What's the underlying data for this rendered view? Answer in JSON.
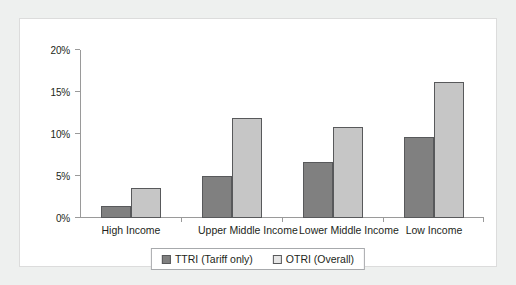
{
  "chart_data": {
    "type": "bar",
    "title": "",
    "subtitle": "",
    "xlabel": "",
    "ylabel": "",
    "ylim": [
      0,
      20
    ],
    "yunit": "%",
    "grid": false,
    "legend_position": "bottom-center",
    "categories": [
      "High Income",
      "Upper Middle Income",
      "Lower Middle Income",
      "Low Income"
    ],
    "ytick_labels": [
      "0%",
      "5%",
      "10%",
      "15%",
      "20%"
    ],
    "ytick_values": [
      0,
      5,
      10,
      15,
      20
    ],
    "series": [
      {
        "name": "TTRI (Tariff only)",
        "color": "#808080",
        "values": [
          1.4,
          5.0,
          6.7,
          9.7
        ]
      },
      {
        "name": "OTRI (Overall)",
        "color": "#c6c6c6",
        "values": [
          3.6,
          11.9,
          10.8,
          16.2
        ]
      }
    ]
  },
  "legend": {
    "items": [
      {
        "label": "TTRI (Tariff only)"
      },
      {
        "label": "OTRI (Overall)"
      }
    ]
  }
}
